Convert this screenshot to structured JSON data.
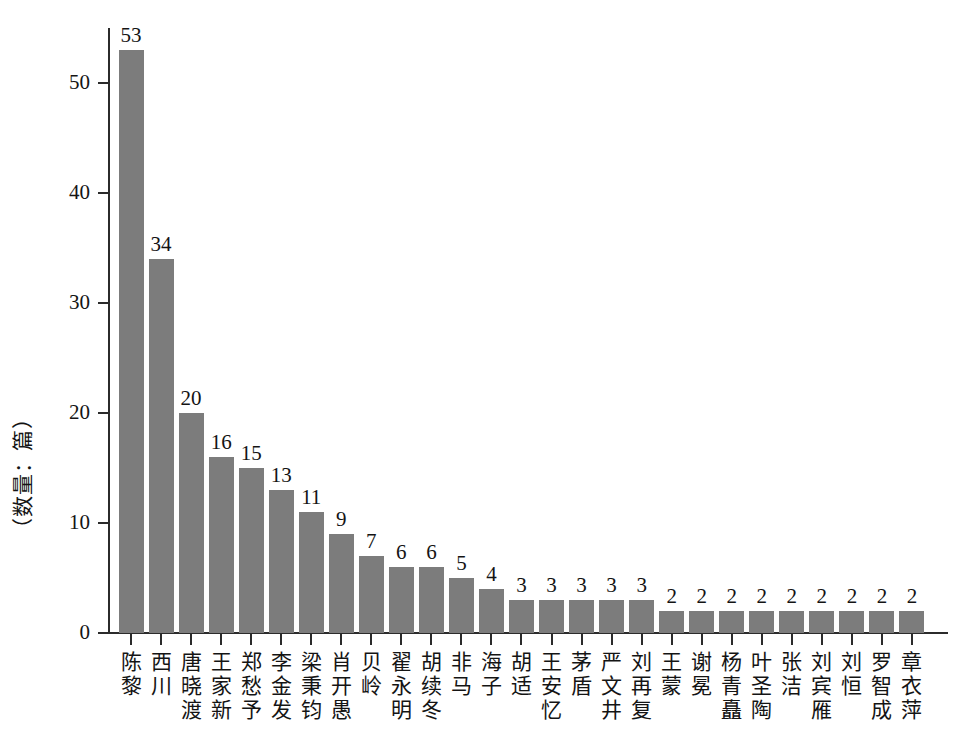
{
  "chart_data": {
    "type": "bar",
    "title": "",
    "subtitle": "",
    "xlabel": "",
    "ylabel": "（数量：篇）",
    "ylim": [
      0,
      55
    ],
    "yticks": [
      0,
      10,
      20,
      30,
      40,
      50
    ],
    "ytick_labels": [
      "0",
      "10",
      "20",
      "30",
      "40",
      "50"
    ],
    "grid": false,
    "legend": null,
    "bar_color": "#7c7c7c",
    "axis_color": "#2b2b2b",
    "value_labels": true,
    "categories": [
      "陈黎",
      "西川",
      "唐晓渡",
      "王家新",
      "郑愁予",
      "李金发",
      "梁秉钧",
      "肖开愚",
      "贝岭",
      "翟永明",
      "胡续冬",
      "非马",
      "海子",
      "胡适",
      "王安忆",
      "茅盾",
      "严文井",
      "刘再复",
      "王蒙",
      "谢冕",
      "杨青矗",
      "叶圣陶",
      "张洁",
      "刘宾雁",
      "刘恒",
      "罗智成",
      "章衣萍"
    ],
    "values": [
      53,
      34,
      20,
      16,
      15,
      13,
      11,
      9,
      7,
      6,
      6,
      5,
      4,
      3,
      3,
      3,
      3,
      3,
      2,
      2,
      2,
      2,
      2,
      2,
      2,
      2,
      2
    ]
  },
  "caption": ""
}
